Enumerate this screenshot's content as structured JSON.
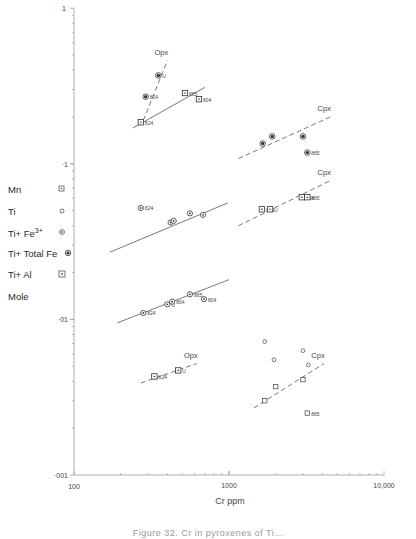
{
  "chart_data": {
    "type": "scatter",
    "title": "",
    "xlabel": "Cr ppm",
    "ylabel": "Mole",
    "xscale": "log",
    "yscale": "log",
    "xlim": [
      100,
      10000
    ],
    "ylim": [
      0.001,
      1
    ],
    "x_ticks": [
      "100",
      "1000",
      "10,000"
    ],
    "y_ticks": [
      "1",
      "·1",
      "·01",
      "·001"
    ],
    "legend": [
      {
        "label": "Mn",
        "symbol": "square-dot"
      },
      {
        "label": "Ti",
        "symbol": "circle-open"
      },
      {
        "label": "Ti+ Fe3+",
        "symbol": "circle-dot"
      },
      {
        "label": "Ti+ Total Fe",
        "symbol": "circle-filled-ring"
      },
      {
        "label": "Ti+ Al",
        "symbol": "square-dot-large"
      },
      {
        "label": "Mole",
        "symbol": ""
      }
    ],
    "series": [
      {
        "name": "Ti+ Total Fe (Opx)",
        "symbol": "circle-filled-ring",
        "points": [
          {
            "x": 290,
            "y": 0.27,
            "label": "824"
          },
          {
            "x": 350,
            "y": 0.37,
            "label": "U"
          }
        ],
        "trend": {
          "style": "dashed",
          "x": [
            280,
            400
          ],
          "y": [
            0.19,
            0.46
          ],
          "label": "Opx"
        }
      },
      {
        "name": "Ti+ Al (Opx)",
        "symbol": "square-dot",
        "points": [
          {
            "x": 270,
            "y": 0.185,
            "label": "824"
          },
          {
            "x": 520,
            "y": 0.285,
            "label": "865"
          },
          {
            "x": 640,
            "y": 0.26,
            "label": "804"
          }
        ],
        "trend": {
          "style": "solid",
          "x": [
            240,
            700
          ],
          "y": [
            0.17,
            0.31
          ]
        }
      },
      {
        "name": "Ti+ Total Fe (Cpx)",
        "symbol": "circle-filled-ring",
        "points": [
          {
            "x": 1650,
            "y": 0.135,
            "label": ""
          },
          {
            "x": 1900,
            "y": 0.15,
            "label": ""
          },
          {
            "x": 3000,
            "y": 0.15,
            "label": ""
          },
          {
            "x": 3200,
            "y": 0.118,
            "label": "865"
          }
        ],
        "trend": {
          "style": "dashed",
          "x": [
            1150,
            4500
          ],
          "y": [
            0.108,
            0.2
          ],
          "label": "Cpx"
        }
      },
      {
        "name": "Ti+ Fe3+ (Opx)",
        "symbol": "circle-dot",
        "points": [
          {
            "x": 270,
            "y": 0.052,
            "label": "824"
          },
          {
            "x": 420,
            "y": 0.042,
            "label": ""
          },
          {
            "x": 440,
            "y": 0.043,
            "label": ""
          },
          {
            "x": 560,
            "y": 0.048,
            "label": ""
          },
          {
            "x": 680,
            "y": 0.047,
            "label": ""
          }
        ],
        "trend": {
          "style": "solid",
          "x": [
            170,
            980
          ],
          "y": [
            0.027,
            0.056
          ]
        }
      },
      {
        "name": "Ti+ Al (Cpx)",
        "symbol": "square-dot",
        "points": [
          {
            "x": 1630,
            "y": 0.051,
            "label": "824"
          },
          {
            "x": 1840,
            "y": 0.051,
            "label": "U"
          },
          {
            "x": 2950,
            "y": 0.061,
            "label": "804"
          },
          {
            "x": 3200,
            "y": 0.061,
            "label": "865"
          }
        ],
        "trend": {
          "style": "dashed",
          "x": [
            1150,
            4500
          ],
          "y": [
            0.04,
            0.078
          ],
          "label": "Cpx"
        }
      },
      {
        "name": "Ti+ Fe3+ (Opx, lower)",
        "symbol": "circle-dot",
        "points": [
          {
            "x": 280,
            "y": 0.011,
            "label": "824"
          },
          {
            "x": 400,
            "y": 0.0125,
            "label": "U"
          },
          {
            "x": 430,
            "y": 0.013,
            "label": "804"
          },
          {
            "x": 560,
            "y": 0.0145,
            "label": "865"
          },
          {
            "x": 690,
            "y": 0.0135,
            "label": "804"
          }
        ],
        "trend": {
          "style": "solid",
          "x": [
            190,
            1000
          ],
          "y": [
            0.0095,
            0.018
          ]
        }
      },
      {
        "name": "Mn (Opx)",
        "symbol": "square-dot",
        "points": [
          {
            "x": 330,
            "y": 0.0043,
            "label": "824"
          },
          {
            "x": 470,
            "y": 0.0047,
            "label": "U"
          }
        ],
        "trend": {
          "style": "dashed",
          "x": [
            270,
            620
          ],
          "y": [
            0.0039,
            0.0052
          ],
          "label": "Opx"
        }
      },
      {
        "name": "Ti (Cpx)",
        "symbol": "circle-open",
        "points": [
          {
            "x": 1700,
            "y": 0.0072,
            "label": ""
          },
          {
            "x": 1950,
            "y": 0.0055,
            "label": ""
          },
          {
            "x": 3000,
            "y": 0.0063,
            "label": ""
          },
          {
            "x": 3250,
            "y": 0.0051,
            "label": ""
          }
        ],
        "trend": null
      },
      {
        "name": "Mn (Cpx)",
        "symbol": "square-open",
        "points": [
          {
            "x": 1700,
            "y": 0.003,
            "label": ""
          },
          {
            "x": 2000,
            "y": 0.0037,
            "label": ""
          },
          {
            "x": 3000,
            "y": 0.0041,
            "label": ""
          },
          {
            "x": 3200,
            "y": 0.0025,
            "label": "865"
          }
        ],
        "trend": {
          "style": "dashed",
          "x": [
            1450,
            4100
          ],
          "y": [
            0.0027,
            0.0052
          ],
          "label": "Cpx"
        }
      }
    ]
  },
  "axis": {
    "x_label": "Cr ppm",
    "x_tick_100": "100",
    "x_tick_1000": "1000",
    "x_tick_10000": "10,000",
    "y_tick_1": "1",
    "y_tick_01": "·1",
    "y_tick_001": "·01",
    "y_tick_0001": "·001"
  },
  "legend": {
    "mn": "Mn",
    "ti": "Ti",
    "ti_fe3_base": "Ti+ Fe",
    "ti_fe3_sup": "3+",
    "ti_total_fe": "Ti+ Total Fe",
    "ti_al": "Ti+ Al",
    "mole": "Mole"
  },
  "caption": "Figure 32. Cr in pyroxenes of Ti..."
}
